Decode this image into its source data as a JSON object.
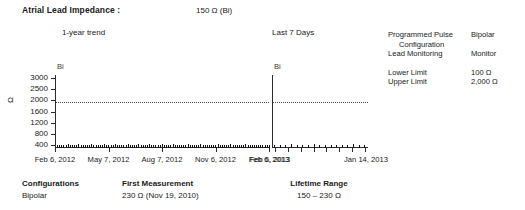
{
  "header": {
    "title": "Atrial Lead Impedance :",
    "value": "150 Ω (Bi)"
  },
  "charts_labels": {
    "left_caption": "1-year trend",
    "right_caption": "Last 7 Days",
    "left_series_label": "Bi",
    "right_series_label": "Bi"
  },
  "parameters": {
    "rows": [
      {
        "name": "Programmed Pulse",
        "value": "Bipolar",
        "indent": false
      },
      {
        "name": "Configuration",
        "value": "",
        "indent": true
      },
      {
        "name": "Lead Monitoring",
        "value": "Monitor",
        "indent": false
      }
    ],
    "limits": [
      {
        "name": "Lower Limit",
        "value": "100 Ω"
      },
      {
        "name": "Upper Limit",
        "value": "2,000 Ω"
      }
    ]
  },
  "footer": {
    "configurations_label": "Configurations",
    "configurations_value": "Bipolar",
    "first_measurement_label": "First Measurement",
    "first_measurement_value": "230 Ω (Nov 19, 2010)",
    "lifetime_range_label": "Lifetime Range",
    "lifetime_range_value": "150 – 230 Ω"
  },
  "chart_data": [
    {
      "type": "scatter",
      "title": "1-year trend",
      "xlabel": "",
      "ylabel": "Ω",
      "series_label": "Bi",
      "ylim": [
        0,
        3200
      ],
      "yticks": [
        3000,
        2500,
        2000,
        1600,
        1200,
        800,
        400
      ],
      "ytick_labels": [
        "3000",
        "2500",
        "2000",
        "1600",
        "1200",
        "800",
        "400"
      ],
      "reference_line": {
        "value": 2000,
        "style": "dotted",
        "label": "Upper Limit"
      },
      "grid": false,
      "legend": "none",
      "xtick_labels": [
        "Feb 6, 2012",
        "May 7, 2012",
        "Aug 7, 2012",
        "Nov 6, 2012",
        "Feb 6, 2013"
      ],
      "x_axis_range": [
        "Feb 6, 2012",
        "Feb 6, 2013"
      ],
      "values": [
        150,
        150,
        155,
        150,
        150,
        160,
        150,
        150,
        155,
        150,
        160,
        150,
        150,
        150,
        155,
        150,
        160,
        150,
        150,
        155,
        150,
        150,
        160,
        155,
        150,
        150,
        155,
        160,
        150,
        150,
        155,
        150,
        150,
        160,
        150,
        155,
        150,
        150,
        160,
        150,
        150,
        155,
        150,
        160,
        150,
        150,
        155,
        150,
        150,
        160,
        150,
        150,
        155,
        150,
        160,
        150,
        155,
        150,
        150,
        150,
        155,
        160,
        150,
        150,
        155,
        150,
        150,
        160,
        150,
        155,
        150,
        150,
        150,
        155,
        150,
        160,
        150,
        150,
        155,
        150,
        150,
        160,
        150,
        155,
        150,
        150,
        155,
        150,
        160,
        150,
        150,
        150,
        150,
        150,
        150,
        150,
        150,
        150,
        150,
        150
      ]
    },
    {
      "type": "scatter",
      "title": "Last 7 Days",
      "xlabel": "",
      "ylabel": "",
      "series_label": "Bi",
      "ylim": [
        0,
        3200
      ],
      "reference_line": {
        "value": 2000,
        "style": "dotted",
        "label": "Upper Limit"
      },
      "grid": false,
      "legend": "none",
      "xtick_labels": [
        "Feb 6, 2013",
        "Jan 14, 2013"
      ],
      "values": [
        150,
        155,
        150,
        160,
        150,
        155,
        150,
        160,
        150,
        155,
        150,
        150,
        155,
        150,
        160,
        150,
        155
      ]
    }
  ]
}
